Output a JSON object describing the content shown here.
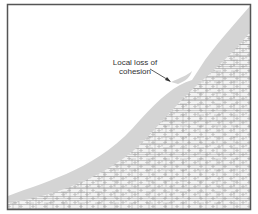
{
  "figure": {
    "type": "slope-cross-section",
    "annotation": {
      "line1": "Local loss of",
      "line2": "cohesion"
    },
    "colors": {
      "frame": "#555555",
      "weathered_layer": "#d4d4d4",
      "rock_hatch": "#9a9a9a",
      "arrow": "#333333"
    }
  }
}
